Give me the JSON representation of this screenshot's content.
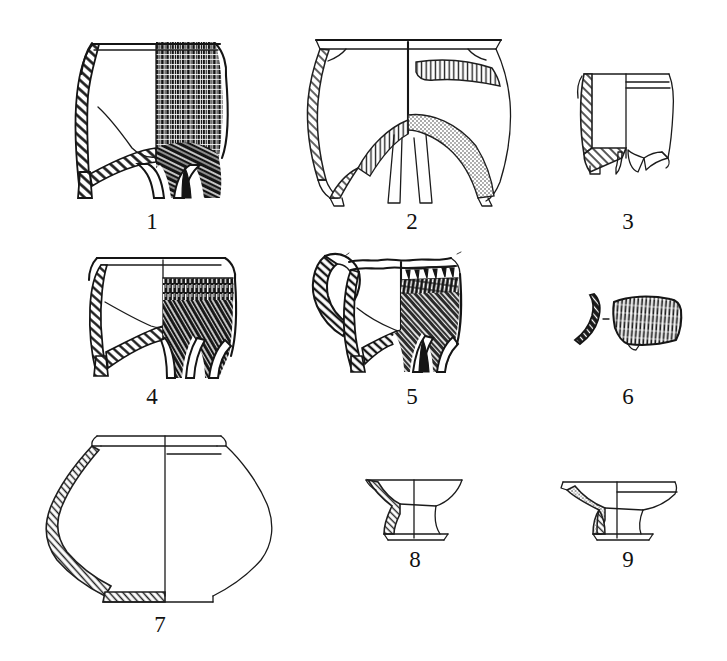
{
  "plate": {
    "kind": "archaeological-pottery-illustration",
    "background_color": "#ffffff",
    "ink_color": "#151515",
    "width": 727,
    "height": 661,
    "rows": 3,
    "columns": 3,
    "total_figures": 9,
    "convention_note": "Each vessel is drawn half in cross-section (left, hatched wall) and half in exterior view (right, surface decoration).",
    "captions": [
      "1",
      "2",
      "3",
      "4",
      "5",
      "6",
      "7",
      "8",
      "9"
    ]
  },
  "figures": [
    {
      "id": 1,
      "label": "1",
      "name": "tripod-vessel-cord-marked",
      "form": "tripod jar (li / ding type)",
      "row": 1,
      "column": 1,
      "label_x": 152,
      "label_y": 213,
      "rim": "flat everted lip",
      "body": "deep straight-to-convex wall",
      "legs": 3,
      "leg_form": "solid conical, dark shaded",
      "section_side": "left",
      "section_fill": "diagonal hatching",
      "exterior_side": "right",
      "decoration": "dense vertical cord-marking over upper body, sweeping diagonal cord-marking over lower body and legs",
      "decoration_density": "heavy",
      "interior_line": "yes"
    },
    {
      "id": 2,
      "label": "2",
      "name": "tripod-vessel-eroded-surface",
      "form": "wide-mouthed tripod jar",
      "row": 1,
      "column": 2,
      "label_x": 412,
      "label_y": 213,
      "rim": "broad horizontal everted flange rim",
      "body": "thin-walled ovoid",
      "legs": 3,
      "leg_form": "slender tapering",
      "section_side": "left",
      "section_fill": "thin outline with narrow hatching",
      "exterior_side": "right",
      "decoration": "irregular patches of stippled and fine-hatched texture on shoulder and lower body (eroded / slipped surface)",
      "decoration_density": "patchy",
      "interior_line": "yes"
    },
    {
      "id": 3,
      "label": "3",
      "name": "tripod-vessel-incised-bands",
      "form": "small straight-sided tripod cup",
      "row": 1,
      "column": 3,
      "label_x": 628,
      "label_y": 213,
      "rim": "plain slightly thickened lip",
      "body": "straight cylindrical wall",
      "legs": 3,
      "leg_form": "short triangular",
      "section_side": "left",
      "section_fill": "diagonal hatching",
      "exterior_side": "right",
      "decoration": "two fine horizontal incised lines below the rim, otherwise plain",
      "decoration_density": "plain",
      "interior_line": "yes"
    },
    {
      "id": 4,
      "label": "4",
      "name": "tripod-vessel-banded-cord-marking",
      "form": "tripod jar with constricted neck",
      "row": 2,
      "column": 1,
      "label_x": 152,
      "label_y": 388,
      "rim": "everted rolled lip",
      "body": "squat convex wall",
      "legs": 3,
      "leg_form": "solid conical, dark shaded",
      "section_side": "left",
      "section_fill": "diagonal hatching",
      "exterior_side": "right",
      "decoration": "vertical cord-marked band below the rim, then dense diagonal cord-marking over body and legs",
      "decoration_density": "heavy",
      "interior_line": "yes"
    },
    {
      "id": 5,
      "label": "5",
      "name": "handled-tripod-vessel",
      "form": "tripod jar with large loop handle",
      "row": 2,
      "column": 2,
      "label_x": 412,
      "label_y": 388,
      "rim": "wavy / notched everted lip",
      "body": "carinated convex wall",
      "legs": 3,
      "leg_form": "solid conical, dark shaded",
      "handle": "large vertical loop handle on the left, shown in hatched section",
      "section_side": "left",
      "section_fill": "diagonal hatching",
      "exterior_side": "right",
      "decoration": "row of appliqué punctate / impressed triangles at the neck, horizontal combed band beneath, then diagonal cord-marking over the body",
      "decoration_density": "heavy",
      "interior_line": "yes"
    },
    {
      "id": 6,
      "label": "6",
      "name": "body-sherd-cord-marked",
      "form": "body sherd (two views)",
      "row": 2,
      "column": 3,
      "label_x": 628,
      "label_y": 388,
      "section_side": "left",
      "section_fill": "dark hatched profile strip",
      "exterior_side": "right",
      "decoration": "dense vertical cord-marking across the exterior face",
      "decoration_density": "heavy",
      "views": [
        "profile section",
        "exterior face"
      ]
    },
    {
      "id": 7,
      "label": "7",
      "name": "globular-jar-plain",
      "form": "large globular jar with flat base",
      "row": 3,
      "column": 1,
      "label_x": 160,
      "label_y": 616,
      "rim": "short everted collar rim with stepped neck",
      "body": "wide globular body, maximum diameter at mid-height",
      "base": "flat, thickened",
      "section_side": "left",
      "section_fill": "narrow diagonal hatching along wall and base",
      "exterior_side": "right",
      "decoration": "undecorated / plain burnished surface",
      "decoration_density": "plain",
      "interior_line": "yes"
    },
    {
      "id": 8,
      "label": "8",
      "name": "pedestal-stand-tall",
      "form": "small pedestal-footed dish / stand (dou type)",
      "row": 3,
      "column": 2,
      "label_x": 415,
      "label_y": 551,
      "rim": "flaring open rim",
      "body": "shallow flaring bowl",
      "base": "splayed hollow pedestal foot",
      "section_side": "left",
      "section_fill": "diagonal hatching",
      "exterior_side": "right",
      "decoration": "plain",
      "decoration_density": "plain",
      "interior_line": "yes"
    },
    {
      "id": 9,
      "label": "9",
      "name": "pedestal-stand-wide",
      "form": "wide pedestal-footed dish / stand (dou type)",
      "row": 3,
      "column": 3,
      "label_x": 628,
      "label_y": 551,
      "rim": "broad flat flaring rim with small lip notch",
      "body": "very shallow wide bowl",
      "base": "short splayed hollow pedestal foot",
      "section_side": "left",
      "section_fill": "diagonal hatching with stippling",
      "exterior_side": "right",
      "decoration": "plain, single horizontal line inside the rim",
      "decoration_density": "plain",
      "interior_line": "yes"
    }
  ]
}
